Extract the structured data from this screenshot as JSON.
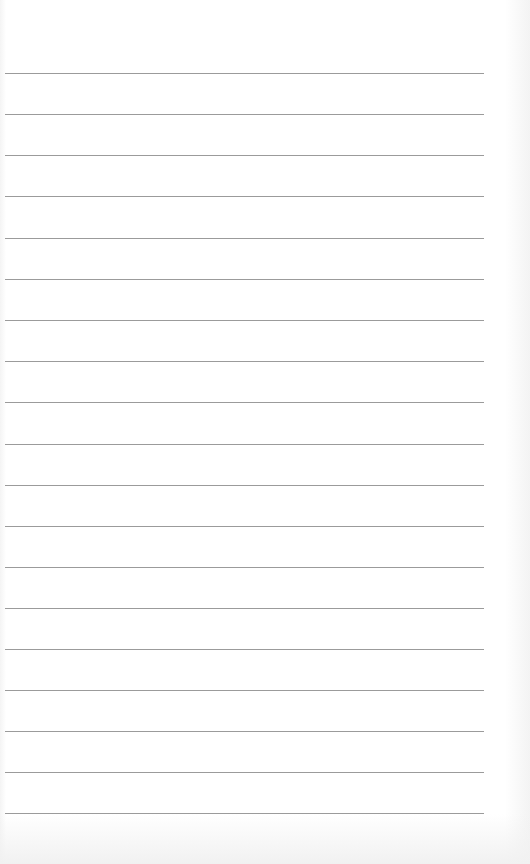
{
  "paper": {
    "type": "lined notebook paper",
    "line_color": "#8a8a8a",
    "background": "#ffffff",
    "line_left": 5,
    "line_width": 479,
    "ruled_lines_y": [
      73,
      114,
      155,
      196,
      238,
      279,
      320,
      361,
      402,
      444,
      485,
      526,
      567,
      608,
      649,
      690,
      731,
      772,
      813
    ]
  }
}
